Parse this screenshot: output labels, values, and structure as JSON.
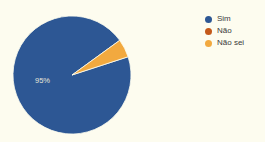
{
  "background_color": "#fdfcef",
  "legend": {
    "position": "right",
    "items": [
      {
        "label": "Sim",
        "color": "#2d5794"
      },
      {
        "label": "Não",
        "color": "#c4591a"
      },
      {
        "label": "Não sei",
        "color": "#f2a93f"
      }
    ]
  },
  "pie": {
    "center_label": "95%",
    "label_color": "#e8e6d8"
  },
  "chart_data": {
    "type": "pie",
    "title": "",
    "categories": [
      "Sim",
      "Não",
      "Não sei"
    ],
    "values": [
      95,
      0,
      5
    ],
    "labels": [
      "95%",
      "",
      ""
    ],
    "colors": [
      "#2d5794",
      "#c4591a",
      "#f2a93f"
    ],
    "legend_position": "right",
    "start_angle_deg": -18,
    "direction": "clockwise"
  }
}
